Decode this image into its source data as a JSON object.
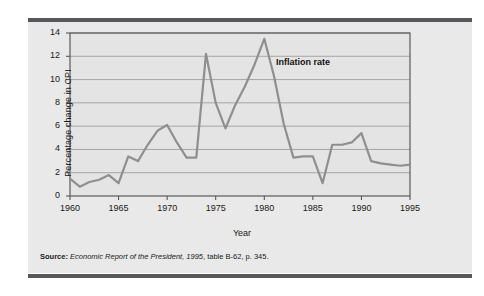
{
  "figure": {
    "panel_background": "#e9e9e9",
    "rule_color": "#58585a",
    "plot_background": "#e4e4e4"
  },
  "source_note": {
    "label": "Source:",
    "italic_part": "Economic Report of the President, 1995",
    "rest": ", table B-62, p. 345."
  },
  "chart_data": {
    "type": "line",
    "title": "",
    "xlabel": "Year",
    "ylabel": "Percentage change in CPI",
    "xlim": [
      1960,
      1995
    ],
    "ylim": [
      0,
      14
    ],
    "xticks": [
      1960,
      1965,
      1970,
      1975,
      1980,
      1985,
      1990,
      1995
    ],
    "yticks": [
      0,
      2,
      4,
      6,
      8,
      10,
      12,
      14
    ],
    "grid": "horizontal",
    "legend_position": "none",
    "line_color": "#8f8f8f",
    "annotations": [
      {
        "text": "Inflation rate",
        "x": 1981.2,
        "y": 11.4
      }
    ],
    "series": [
      {
        "name": "Inflation rate",
        "x": [
          1960,
          1961,
          1962,
          1963,
          1964,
          1965,
          1966,
          1967,
          1968,
          1969,
          1970,
          1971,
          1972,
          1973,
          1974,
          1975,
          1976,
          1977,
          1978,
          1979,
          1980,
          1981,
          1982,
          1983,
          1984,
          1985,
          1986,
          1987,
          1988,
          1989,
          1990,
          1991,
          1992,
          1993,
          1994,
          1995
        ],
        "values": [
          1.5,
          0.8,
          1.2,
          1.4,
          1.8,
          1.1,
          3.4,
          3.0,
          4.4,
          5.6,
          6.1,
          4.6,
          3.3,
          3.3,
          12.2,
          8.0,
          5.8,
          7.8,
          9.4,
          11.3,
          13.5,
          10.3,
          6.2,
          3.3,
          3.4,
          3.4,
          1.1,
          4.4,
          4.4,
          4.6,
          5.4,
          3.0,
          2.8,
          2.7,
          2.6,
          2.7
        ]
      }
    ]
  }
}
